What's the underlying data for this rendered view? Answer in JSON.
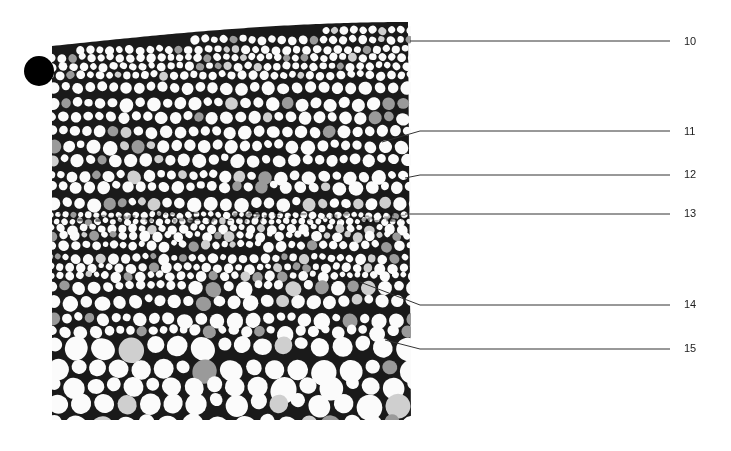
{
  "figure": {
    "type": "stem cross-section micrograph",
    "marker": "black-dot",
    "labels": [
      {
        "id": "10",
        "text": "10"
      },
      {
        "id": "11",
        "text": "11"
      },
      {
        "id": "12",
        "text": "12"
      },
      {
        "id": "13",
        "text": "13"
      },
      {
        "id": "14",
        "text": "14"
      },
      {
        "id": "15",
        "text": "15"
      }
    ],
    "colors": {
      "ink": "#111111",
      "line": "#333333",
      "background": "#ffffff"
    }
  }
}
